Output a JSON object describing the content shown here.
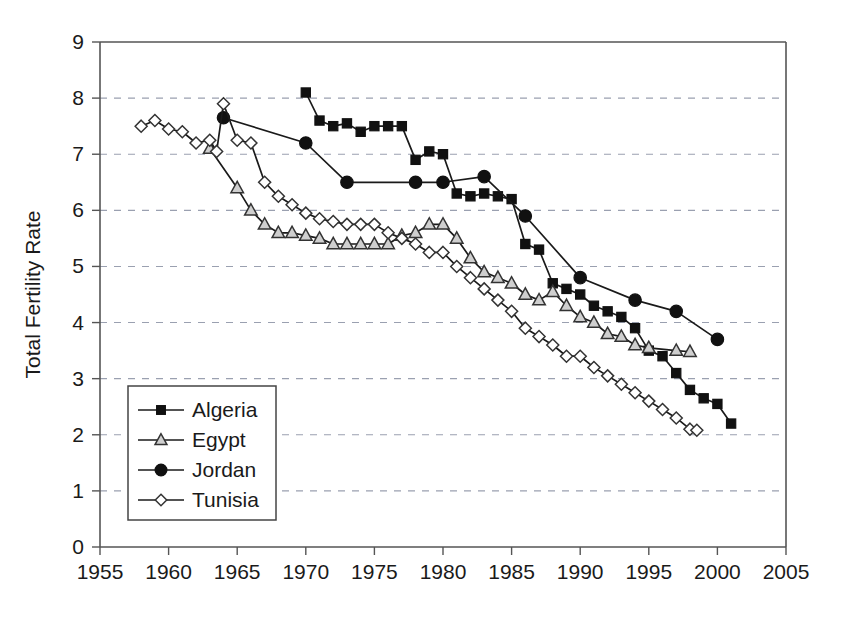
{
  "chart_data": {
    "type": "line",
    "title": "",
    "xlabel": "",
    "ylabel": "Total Fertility Rate",
    "xlim": [
      1955,
      2005
    ],
    "ylim": [
      0,
      9
    ],
    "xticks": [
      1955,
      1960,
      1965,
      1970,
      1975,
      1980,
      1985,
      1990,
      1995,
      2000,
      2005
    ],
    "yticks": [
      0,
      1,
      2,
      3,
      4,
      5,
      6,
      7,
      8,
      9
    ],
    "grid": "horizontal-dashed",
    "legend_position": "inside-lower-left",
    "series": [
      {
        "name": "Algeria",
        "marker": "filled-square",
        "points": [
          [
            1970,
            8.1
          ],
          [
            1971,
            7.6
          ],
          [
            1972,
            7.5
          ],
          [
            1973,
            7.55
          ],
          [
            1974,
            7.4
          ],
          [
            1975,
            7.5
          ],
          [
            1976,
            7.5
          ],
          [
            1977,
            7.5
          ],
          [
            1978,
            6.9
          ],
          [
            1979,
            7.05
          ],
          [
            1980,
            7.0
          ],
          [
            1981,
            6.3
          ],
          [
            1982,
            6.25
          ],
          [
            1983,
            6.3
          ],
          [
            1984,
            6.25
          ],
          [
            1985,
            6.2
          ],
          [
            1986,
            5.4
          ],
          [
            1987,
            5.3
          ],
          [
            1988,
            4.7
          ],
          [
            1989,
            4.6
          ],
          [
            1990,
            4.5
          ],
          [
            1991,
            4.3
          ],
          [
            1992,
            4.2
          ],
          [
            1993,
            4.1
          ],
          [
            1994,
            3.9
          ],
          [
            1995,
            3.5
          ],
          [
            1996,
            3.4
          ],
          [
            1997,
            3.1
          ],
          [
            1998,
            2.8
          ],
          [
            1999,
            2.65
          ],
          [
            2000,
            2.55
          ],
          [
            2001,
            2.2
          ]
        ]
      },
      {
        "name": "Egypt",
        "marker": "open-triangle",
        "points": [
          [
            1963,
            7.1
          ],
          [
            1965,
            6.4
          ],
          [
            1966,
            6.0
          ],
          [
            1967,
            5.75
          ],
          [
            1968,
            5.6
          ],
          [
            1969,
            5.6
          ],
          [
            1970,
            5.55
          ],
          [
            1971,
            5.5
          ],
          [
            1972,
            5.4
          ],
          [
            1973,
            5.4
          ],
          [
            1974,
            5.4
          ],
          [
            1975,
            5.4
          ],
          [
            1976,
            5.4
          ],
          [
            1977,
            5.55
          ],
          [
            1978,
            5.6
          ],
          [
            1979,
            5.75
          ],
          [
            1980,
            5.75
          ],
          [
            1981,
            5.5
          ],
          [
            1982,
            5.15
          ],
          [
            1983,
            4.9
          ],
          [
            1984,
            4.8
          ],
          [
            1985,
            4.7
          ],
          [
            1986,
            4.5
          ],
          [
            1987,
            4.4
          ],
          [
            1988,
            4.55
          ],
          [
            1989,
            4.3
          ],
          [
            1990,
            4.1
          ],
          [
            1991,
            4.0
          ],
          [
            1992,
            3.8
          ],
          [
            1993,
            3.75
          ],
          [
            1994,
            3.6
          ],
          [
            1995,
            3.55
          ],
          [
            1997,
            3.5
          ],
          [
            1998,
            3.48
          ]
        ]
      },
      {
        "name": "Jordan",
        "marker": "filled-circle",
        "points": [
          [
            1964,
            7.65
          ],
          [
            1970,
            7.2
          ],
          [
            1973,
            6.5
          ],
          [
            1978,
            6.5
          ],
          [
            1980,
            6.5
          ],
          [
            1983,
            6.6
          ],
          [
            1986,
            5.9
          ],
          [
            1990,
            4.8
          ],
          [
            1994,
            4.4
          ],
          [
            1997,
            4.2
          ],
          [
            2000,
            3.7
          ]
        ]
      },
      {
        "name": "Tunisia",
        "marker": "open-diamond",
        "points": [
          [
            1958,
            7.5
          ],
          [
            1959,
            7.6
          ],
          [
            1960,
            7.45
          ],
          [
            1961,
            7.4
          ],
          [
            1962,
            7.2
          ],
          [
            1963,
            7.25
          ],
          [
            1963.5,
            7.05
          ],
          [
            1964,
            7.9
          ],
          [
            1965,
            7.25
          ],
          [
            1966,
            7.2
          ],
          [
            1967,
            6.5
          ],
          [
            1968,
            6.25
          ],
          [
            1969,
            6.1
          ],
          [
            1970,
            5.95
          ],
          [
            1971,
            5.85
          ],
          [
            1972,
            5.8
          ],
          [
            1973,
            5.75
          ],
          [
            1974,
            5.75
          ],
          [
            1975,
            5.75
          ],
          [
            1976,
            5.6
          ],
          [
            1977,
            5.5
          ],
          [
            1978,
            5.4
          ],
          [
            1979,
            5.25
          ],
          [
            1980,
            5.25
          ],
          [
            1981,
            5.0
          ],
          [
            1982,
            4.8
          ],
          [
            1983,
            4.6
          ],
          [
            1984,
            4.4
          ],
          [
            1985,
            4.2
          ],
          [
            1986,
            3.9
          ],
          [
            1987,
            3.75
          ],
          [
            1988,
            3.6
          ],
          [
            1989,
            3.4
          ],
          [
            1990,
            3.4
          ],
          [
            1991,
            3.2
          ],
          [
            1992,
            3.05
          ],
          [
            1993,
            2.9
          ],
          [
            1994,
            2.75
          ],
          [
            1995,
            2.6
          ],
          [
            1996,
            2.45
          ],
          [
            1997,
            2.3
          ],
          [
            1998,
            2.1
          ],
          [
            1998.5,
            2.08
          ]
        ]
      }
    ]
  },
  "legend": {
    "entries": [
      {
        "label": "Algeria",
        "marker": "filled-square"
      },
      {
        "label": "Egypt",
        "marker": "open-triangle"
      },
      {
        "label": "Jordan",
        "marker": "filled-circle"
      },
      {
        "label": "Tunisia",
        "marker": "open-diamond"
      }
    ]
  },
  "axes": {
    "y_title": "Total Fertility Rate",
    "x_tick_labels": [
      "1955",
      "1960",
      "1965",
      "1970",
      "1975",
      "1980",
      "1985",
      "1990",
      "1995",
      "2000",
      "2005"
    ],
    "y_tick_labels": [
      "0",
      "1",
      "2",
      "3",
      "4",
      "5",
      "6",
      "7",
      "8",
      "9"
    ]
  },
  "colors": {
    "line": "#1a1a1a",
    "grid": "#9aa0b0",
    "axis": "#555555",
    "marker_fill": "#111111",
    "marker_open": "#ffffff",
    "marker_shaded": "#cfcfcf",
    "background": "#ffffff"
  }
}
